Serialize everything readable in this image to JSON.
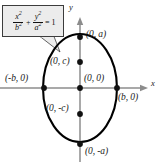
{
  "figure": {
    "type": "ellipse-diagram",
    "width": 161,
    "height": 164,
    "background_color": "#ffffff"
  },
  "equation_callout": {
    "name": "ellipse-standard-equation",
    "text": "x^2/b^2 + y^2/a^2 = 1",
    "numerator_1": "x",
    "numerator_1_exponent": "2",
    "denominator_1": "b",
    "denominator_1_exponent": "2",
    "operator": "+",
    "numerator_2": "y",
    "numerator_2_exponent": "2",
    "denominator_2": "a",
    "denominator_2_exponent": "2",
    "equals": "= 1",
    "fill_color": "#ececec",
    "border_color": "#3c3c3c"
  },
  "axes": {
    "x_label": "x",
    "y_label": "y",
    "color": "#8c8c8c"
  },
  "curve": {
    "name": "ellipse",
    "color": "#000000",
    "center_px": [
      80,
      88
    ],
    "semi_axis_x_px": 37,
    "semi_axis_y_px": 54,
    "stroke_width": 2.1
  },
  "points": [
    {
      "label": "(0, a)",
      "name": "vertex-top",
      "x": 80,
      "y": 37,
      "label_x": 86,
      "label_y": 30
    },
    {
      "label": "(0, c)",
      "name": "focus-upper",
      "x": 80,
      "y": 62,
      "label_x": 50,
      "label_y": 57
    },
    {
      "label": "(0, 0)",
      "name": "center",
      "x": 80,
      "y": 88,
      "label_x": 84,
      "label_y": 74
    },
    {
      "label": "(-b, 0)",
      "name": "vertex-left",
      "x": 44,
      "y": 88,
      "label_x": 5,
      "label_y": 74
    },
    {
      "label": "(b, 0)",
      "name": "vertex-right",
      "x": 117,
      "y": 88,
      "label_x": 118,
      "label_y": 93
    },
    {
      "label": "(0, -c)",
      "name": "focus-lower",
      "x": 80,
      "y": 114,
      "label_x": 46,
      "label_y": 104
    },
    {
      "label": "(0, -a)",
      "name": "vertex-bottom",
      "x": 80,
      "y": 144,
      "label_x": 85,
      "label_y": 147
    }
  ]
}
